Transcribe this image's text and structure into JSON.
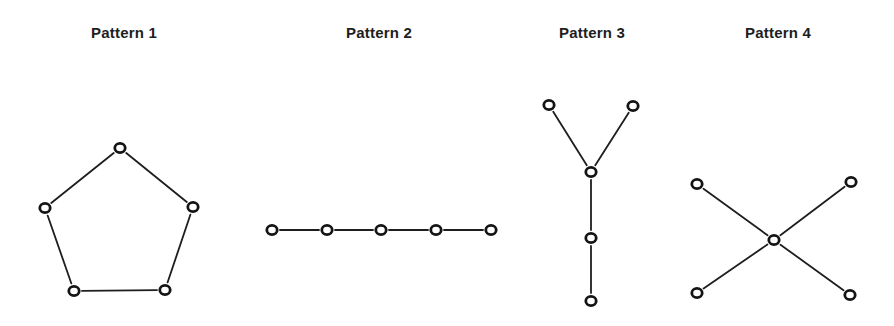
{
  "patterns": [
    {
      "title": "Pattern 1",
      "title_x": 124,
      "shape": "pentagon-ring",
      "nodes": [
        [
          120,
          148
        ],
        [
          45,
          208
        ],
        [
          193,
          207
        ],
        [
          74,
          291
        ],
        [
          165,
          290
        ]
      ],
      "edges": [
        [
          0,
          1
        ],
        [
          0,
          2
        ],
        [
          1,
          3
        ],
        [
          2,
          4
        ],
        [
          3,
          4
        ]
      ]
    },
    {
      "title": "Pattern 2",
      "title_x": 379,
      "shape": "chain",
      "nodes": [
        [
          272,
          230
        ],
        [
          327,
          230
        ],
        [
          381,
          230
        ],
        [
          436,
          230
        ],
        [
          491,
          230
        ]
      ],
      "edges": [
        [
          0,
          1
        ],
        [
          1,
          2
        ],
        [
          2,
          3
        ],
        [
          3,
          4
        ]
      ]
    },
    {
      "title": "Pattern 3",
      "title_x": 592,
      "shape": "y-tree",
      "nodes": [
        [
          549,
          105
        ],
        [
          633,
          106
        ],
        [
          591,
          172
        ],
        [
          591,
          238
        ],
        [
          591,
          301
        ]
      ],
      "edges": [
        [
          0,
          2
        ],
        [
          1,
          2
        ],
        [
          2,
          3
        ],
        [
          3,
          4
        ]
      ]
    },
    {
      "title": "Pattern 4",
      "title_x": 778,
      "shape": "x-star",
      "nodes": [
        [
          697,
          184
        ],
        [
          851,
          182
        ],
        [
          774,
          240
        ],
        [
          697,
          293
        ],
        [
          850,
          295
        ]
      ],
      "edges": [
        [
          0,
          2
        ],
        [
          1,
          2
        ],
        [
          2,
          3
        ],
        [
          2,
          4
        ]
      ]
    }
  ],
  "colors": {
    "line": "#1e1e1e",
    "node": "#141414",
    "background": "#ffffff"
  }
}
